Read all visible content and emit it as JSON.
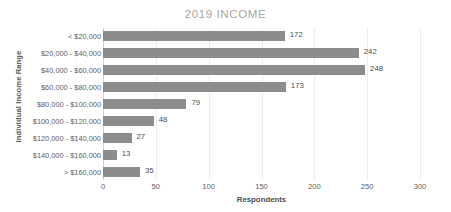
{
  "chart_data": {
    "type": "bar",
    "orientation": "horizontal",
    "title": "2019 INCOME",
    "xlabel": "Respondents",
    "ylabel": "Individual Income Range",
    "categories": [
      "< $20,000",
      "$20,000 - $40,000",
      "$40,000 - $60,000",
      "$60,000 - $80,000",
      "$80,000 - $100,000",
      "$100,000 - $120,000",
      "$120,000 - $140,000",
      "$140,000 - $160,000",
      "> $160,000"
    ],
    "values": [
      172,
      242,
      248,
      173,
      79,
      48,
      27,
      13,
      35
    ],
    "data_labels": [
      "172",
      "242",
      "248",
      "173",
      "79",
      "48",
      "27",
      "13",
      "35"
    ],
    "xlim": [
      0,
      300
    ],
    "xticks": [
      0,
      50,
      100,
      150,
      200,
      250,
      300
    ],
    "xtick_labels": [
      "0",
      "50",
      "100",
      "150",
      "200",
      "250",
      "300"
    ],
    "grid": "vertical",
    "legend": "none",
    "bar_color": "#8c8c8c",
    "title_color": "#a6a6a6",
    "gridline_color": "#ececec",
    "axis_text_color": "#5e5e5e"
  }
}
